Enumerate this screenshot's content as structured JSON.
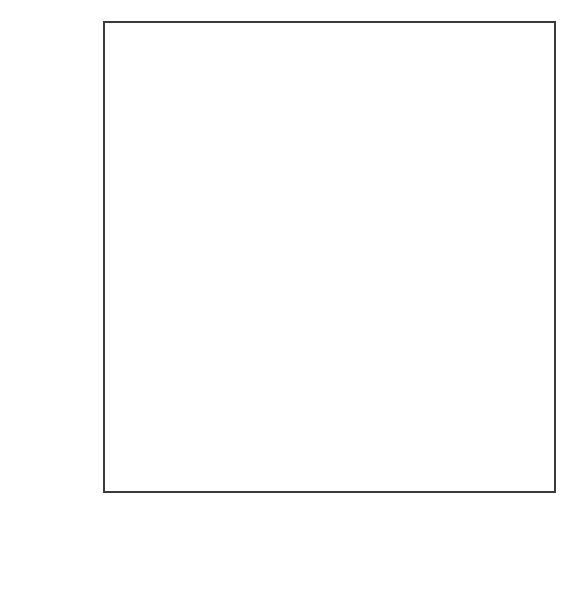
{
  "chart_data": {
    "type": "line",
    "title": "",
    "subtitle": "",
    "xlabel": "year",
    "ylabel": "lifeExp",
    "x": [
      2002,
      2007
    ],
    "x_tick_labels": [
      "2002",
      "2003",
      "2004",
      "2005",
      "2006",
      "2007"
    ],
    "x_ticks": [
      2002,
      2003,
      2004,
      2005,
      2006,
      2007
    ],
    "y_tick_labels": [
      "80",
      "70",
      "60",
      "50"
    ],
    "y_ticks": [
      80,
      70,
      60,
      50
    ],
    "xlim": [
      2001.75,
      2007.25
    ],
    "ylim": [
      42.0,
      83.3
    ],
    "grid": true,
    "grid_major_color": "#f2f2f2",
    "grid_minor_color": "#fafafa",
    "line_color": "#0d0d0d",
    "panel_background": "#ffffff",
    "panel_border_color": "#3a3a3a",
    "legend": "none",
    "legend_position": "none",
    "annotations": [],
    "series": [
      {
        "name": "Iceland",
        "values": [
          80.5,
          81.757
        ]
      },
      {
        "name": "Switzerland",
        "values": [
          80.62,
          81.701
        ]
      },
      {
        "name": "Spain",
        "values": [
          79.78,
          80.941
        ]
      },
      {
        "name": "Sweden",
        "values": [
          80.04,
          80.884
        ]
      },
      {
        "name": "France",
        "values": [
          79.59,
          80.657
        ]
      },
      {
        "name": "Italy",
        "values": [
          80.24,
          80.546
        ]
      },
      {
        "name": "Norway",
        "values": [
          79.05,
          80.196
        ]
      },
      {
        "name": "Austria",
        "values": [
          78.98,
          79.829
        ]
      },
      {
        "name": "Netherlands",
        "values": [
          78.53,
          79.762
        ]
      },
      {
        "name": "Greece",
        "values": [
          78.256,
          79.483
        ]
      },
      {
        "name": "Belgium",
        "values": [
          78.32,
          79.441
        ]
      },
      {
        "name": "United Kingdom",
        "values": [
          78.471,
          79.425
        ]
      },
      {
        "name": "Germany",
        "values": [
          78.67,
          79.406
        ]
      },
      {
        "name": "Finland",
        "values": [
          78.37,
          79.313
        ]
      },
      {
        "name": "Ireland",
        "values": [
          77.783,
          78.885
        ]
      },
      {
        "name": "Denmark",
        "values": [
          77.18,
          78.332
        ]
      },
      {
        "name": "Portugal",
        "values": [
          77.29,
          78.098
        ]
      },
      {
        "name": "Slovenia",
        "values": [
          76.66,
          77.926
        ]
      },
      {
        "name": "Czech Republic",
        "values": [
          75.51,
          76.486
        ]
      },
      {
        "name": "Croatia",
        "values": [
          74.876,
          75.748
        ]
      },
      {
        "name": "Albania",
        "values": [
          75.651,
          76.423
        ]
      },
      {
        "name": "Poland",
        "values": [
          74.67,
          75.563
        ]
      },
      {
        "name": "Bosnia and Herzegovina",
        "values": [
          74.09,
          74.852
        ]
      },
      {
        "name": "Slovak Republic",
        "values": [
          73.8,
          74.663
        ]
      },
      {
        "name": "Montenegro",
        "values": [
          73.981,
          74.543
        ]
      },
      {
        "name": "Serbia",
        "values": [
          73.213,
          74.002
        ]
      },
      {
        "name": "Hungary",
        "values": [
          72.59,
          73.338
        ]
      },
      {
        "name": "Bulgaria",
        "values": [
          72.14,
          73.005
        ]
      },
      {
        "name": "Romania",
        "values": [
          71.322,
          72.476
        ]
      },
      {
        "name": "Turkey",
        "values": [
          70.845,
          71.777
        ]
      },
      {
        "name": "Estonia",
        "values": [
          71.0,
          71.442
        ]
      },
      {
        "name": "Lithuania",
        "values": [
          72.0,
          72.0
        ]
      },
      {
        "name": "Latvia",
        "values": [
          70.8,
          71.0
        ]
      },
      {
        "name": "Ukraine",
        "values": [
          69.6,
          70.3
        ]
      },
      {
        "name": "Belarus",
        "values": [
          68.8,
          69.6
        ]
      },
      {
        "name": "Russia",
        "values": [
          66.7,
          67.3
        ]
      },
      {
        "name": "Kazakhstan",
        "values": [
          65.2,
          66.0
        ]
      },
      {
        "name": "Moldova",
        "values": [
          63.7,
          64.7
        ]
      },
      {
        "name": "Uzbekistan",
        "values": [
          63.0,
          64.2
        ]
      },
      {
        "name": "Kyrgyzstan",
        "values": [
          62.6,
          63.8
        ]
      },
      {
        "name": "Azerbaijan",
        "values": [
          61.9,
          63.2
        ]
      },
      {
        "name": "Tajikistan",
        "values": [
          61.4,
          62.1
        ]
      },
      {
        "name": "Turkmenistan",
        "values": [
          60.3,
          62.2
        ]
      },
      {
        "name": "Mongolia",
        "values": [
          60.1,
          61.8
        ]
      },
      {
        "name": "Cambodia",
        "values": [
          56.8,
          59.7
        ]
      },
      {
        "name": "Afghanistan",
        "values": [
          42.5,
          43.8
        ]
      }
    ]
  },
  "axes": {
    "y_title": "lifeExp",
    "x_title": "year"
  }
}
